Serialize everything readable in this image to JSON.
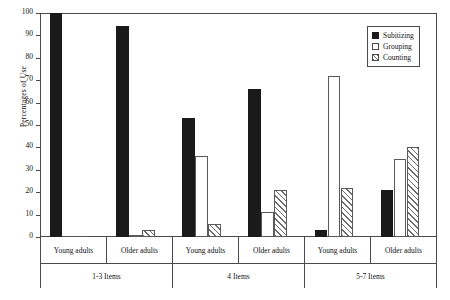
{
  "chart_data": {
    "type": "bar",
    "title": "",
    "xlabel": "",
    "ylabel": "Percentages of Use",
    "ylim": [
      0,
      100
    ],
    "yticks": [
      0,
      10,
      20,
      30,
      40,
      50,
      60,
      70,
      80,
      90,
      100
    ],
    "grid": false,
    "legend_position": "top-right",
    "categories": [
      "Young adults",
      "Older adults",
      "Young adults",
      "Older adults",
      "Young adults",
      "Older adults"
    ],
    "group_labels": [
      "1-3 Items",
      "4 Items",
      "5-7 Items"
    ],
    "series": [
      {
        "name": "Subitizing",
        "color": "#1a1a1a",
        "fill": "solid-black",
        "values": [
          100,
          94,
          53,
          66,
          3,
          21
        ]
      },
      {
        "name": "Grouping",
        "color": "#ffffff",
        "fill": "open-white",
        "values": [
          0,
          1,
          36,
          11,
          72,
          35
        ]
      },
      {
        "name": "Counting",
        "color": "#6b6b6b",
        "fill": "diagonal-hatch",
        "values": [
          0,
          3,
          6,
          21,
          22,
          40
        ]
      }
    ]
  },
  "axis": {
    "y_title": "Percentages of Use",
    "tick_labels": [
      "100",
      "90",
      "80",
      "70",
      "60",
      "50",
      "40",
      "30",
      "20",
      "10",
      "0"
    ]
  },
  "legend": {
    "items": [
      {
        "label": "Subitizing"
      },
      {
        "label": "Grouping"
      },
      {
        "label": "Counting"
      }
    ]
  },
  "x_axis": {
    "tier1": [
      "Young adults",
      "Older adults",
      "Young adults",
      "Older adults",
      "Young adults",
      "Older adults"
    ],
    "tier2": [
      "1-3 Items",
      "4 Items",
      "5-7 Items"
    ]
  }
}
